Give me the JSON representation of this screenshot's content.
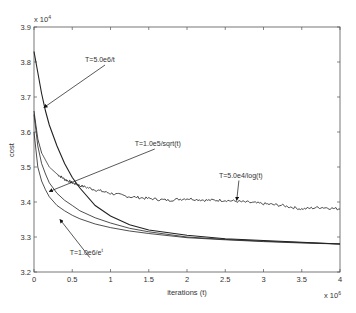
{
  "chart_data": {
    "type": "line",
    "title": "",
    "xlabel": "iterations (t)",
    "ylabel": "cost",
    "x_multiplier": "x 10^6",
    "y_multiplier": "x 10^4",
    "xlim": [
      0,
      4
    ],
    "ylim": [
      3.2,
      3.9
    ],
    "xticks": [
      0,
      0.5,
      1,
      1.5,
      2,
      2.5,
      3,
      3.5,
      4
    ],
    "xtick_labels": [
      "0",
      "0.5",
      "1",
      "1.5",
      "2",
      "2.5",
      "3",
      "3.5",
      "4"
    ],
    "yticks": [
      3.2,
      3.3,
      3.4,
      3.5,
      3.6,
      3.7,
      3.8,
      3.9
    ],
    "ytick_labels": [
      "3.2",
      "3.3",
      "3.4",
      "3.5",
      "3.6",
      "3.7",
      "3.8",
      "3.9"
    ],
    "grid": false,
    "legend": "none (inline annotations)",
    "series": [
      {
        "name": "T=5.0e6/t",
        "x": [
          0.0,
          0.05,
          0.1,
          0.15,
          0.2,
          0.3,
          0.4,
          0.5,
          0.6,
          0.8,
          1.0,
          1.25,
          1.5,
          2.0,
          2.5,
          3.0,
          3.5,
          4.0
        ],
        "y": [
          3.83,
          3.77,
          3.71,
          3.66,
          3.62,
          3.56,
          3.51,
          3.47,
          3.44,
          3.39,
          3.36,
          3.335,
          3.32,
          3.305,
          3.295,
          3.29,
          3.285,
          3.28
        ]
      },
      {
        "name": "T=5.0e4/log(t)",
        "x": [
          0.0,
          0.05,
          0.1,
          0.15,
          0.2,
          0.3,
          0.4,
          0.5,
          0.6,
          0.8,
          1.0,
          1.25,
          1.5,
          1.75,
          2.0,
          2.25,
          2.5,
          2.75,
          3.0,
          3.25,
          3.5,
          3.75,
          4.0
        ],
        "y": [
          3.66,
          3.58,
          3.54,
          3.52,
          3.5,
          3.48,
          3.465,
          3.455,
          3.447,
          3.435,
          3.425,
          3.415,
          3.41,
          3.405,
          3.41,
          3.405,
          3.405,
          3.4,
          3.395,
          3.39,
          3.38,
          3.385,
          3.38
        ],
        "noisy": true
      },
      {
        "name": "T=1.0e5/sqrt(t)",
        "x": [
          0.0,
          0.05,
          0.1,
          0.15,
          0.2,
          0.3,
          0.4,
          0.5,
          0.6,
          0.8,
          1.0,
          1.25,
          1.5,
          2.0,
          2.5,
          3.0,
          3.5,
          4.0
        ],
        "y": [
          3.65,
          3.56,
          3.51,
          3.48,
          3.455,
          3.425,
          3.405,
          3.39,
          3.375,
          3.355,
          3.34,
          3.325,
          3.315,
          3.3,
          3.293,
          3.288,
          3.284,
          3.28
        ]
      },
      {
        "name": "T=1.0e6/e^t",
        "x": [
          0.0,
          0.05,
          0.1,
          0.15,
          0.2,
          0.3,
          0.4,
          0.5,
          0.6,
          0.8,
          1.0,
          1.25,
          1.5,
          2.0,
          2.5,
          3.0,
          3.5,
          4.0
        ],
        "y": [
          3.6,
          3.5,
          3.46,
          3.435,
          3.415,
          3.39,
          3.375,
          3.362,
          3.352,
          3.337,
          3.327,
          3.317,
          3.31,
          3.298,
          3.292,
          3.287,
          3.283,
          3.28
        ]
      }
    ],
    "annotations": [
      {
        "text": "T=5.0e6/t",
        "text_x": 0.85,
        "text_y": 3.8,
        "arrow_to_x": 0.13,
        "arrow_to_y": 3.67
      },
      {
        "text": "T=1.0e5/sqrt(t)",
        "text_x": 1.5,
        "text_y": 3.56,
        "arrow_to_x": 0.2,
        "arrow_to_y": 3.43
      },
      {
        "text": "T=5.0e4/log(t)",
        "text_x": 2.6,
        "text_y": 3.47,
        "arrow_to_x": 2.65,
        "arrow_to_y": 3.405
      },
      {
        "text": "T=1.0e6/e^t",
        "text_x": 0.65,
        "text_y": 3.25,
        "arrow_to_x": 0.34,
        "arrow_to_y": 3.35
      }
    ]
  }
}
